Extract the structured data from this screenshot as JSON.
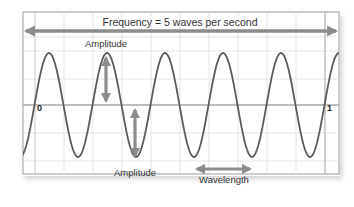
{
  "title": "Frequency = 5 waves per second",
  "labels": {
    "amplitude_top": "Amplitude",
    "amplitude_bottom": "Amplitude",
    "wavelength": "Wavelength",
    "axis_start": "0",
    "axis_end": "1"
  },
  "colors": {
    "wave": "#5a5a5a",
    "arrow": "#8c8c8c",
    "grid": "#dedede",
    "axis": "#a8a8a8",
    "frame": "#9a9a9a",
    "text": "#333333"
  },
  "wave": {
    "frequency_hz": 5,
    "duration_s": 1,
    "peaks_visible": 6,
    "troughs_visible": 5
  }
}
